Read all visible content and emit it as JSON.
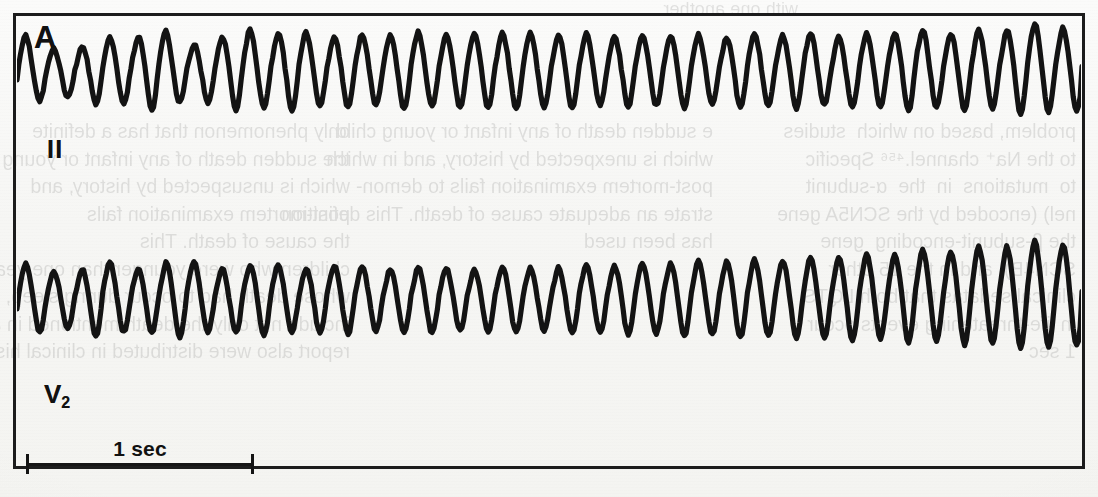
{
  "figure": {
    "panel_label": "A",
    "leads": [
      {
        "name": "lead-II",
        "label": "II",
        "label_sub": ""
      },
      {
        "name": "lead-V2",
        "label": "V",
        "label_sub": "2"
      }
    ],
    "scale_bar": {
      "label": "1 sec",
      "duration_seconds": 1,
      "pixel_length": 228
    },
    "frame_color": "#1a1a1a",
    "trace_color": "#121212",
    "background_color": "#f6f6f4"
  },
  "showthrough_text": {
    "top": "with one another.",
    "left": "problem, based on which  studies\nto the Na⁺ channel.⁴⁵⁶ Specific\nto  mutations  in  the  α-subunit\nnel) (encoded by the SCN5A gene\nthe β-subunit-encoding  gene\nSCN4B), and in the 15 other\nclinical sedatas that both LQTS\nin life-threatening events occur\n1 sec",
    "mid": "e sudden death of any infant or young child\nwhich is unexpected by history, and in which\npost-mortem examination fails to demon-\nstrate an adequate cause of death. This definition\nhas been used",
    "right": "only phenomenon that has a definite\nthe sudden death of any infant or young\nwhich is unsuspected by history, and\npost-mortem examination fails\nthe cause of death. This\nchildren who were younger than one year\nwhose death had to occur during sleep, and had to\ninclude not only the death mentioned in a prior\nreport also were distributed in clinical history, and a"
  },
  "chart_data": {
    "type": "line",
    "title": "A",
    "xlabel": "",
    "ylabel": "",
    "grid": false,
    "legend": "none",
    "x_scale": {
      "bar_label": "1 sec",
      "seconds_per_bar": 1
    },
    "series": [
      {
        "name": "II",
        "note": "Lead II rhythm strip — polymorphic wide-complex tachycardia with undulating (torsades-like) amplitude",
        "baseline_y": 80,
        "cycles": 38,
        "amplitude_envelope": [
          52,
          34,
          30,
          46,
          40,
          58,
          36,
          40,
          56,
          46,
          54,
          42,
          50,
          44,
          52,
          46,
          50,
          48,
          50,
          46,
          50,
          44,
          48,
          44,
          50,
          42,
          50,
          44,
          52,
          42,
          50,
          46,
          56,
          46,
          54,
          48,
          62,
          54
        ]
      },
      {
        "name": "V2",
        "note": "Lead V2 rhythm strip — simultaneous recording, amplitude grows toward right",
        "baseline_y": 308,
        "cycles": 38,
        "amplitude_envelope": [
          50,
          40,
          36,
          52,
          40,
          44,
          54,
          40,
          44,
          48,
          40,
          44,
          46,
          40,
          42,
          44,
          38,
          44,
          42,
          40,
          46,
          42,
          48,
          44,
          50,
          46,
          52,
          48,
          54,
          50,
          58,
          52,
          62,
          56,
          66,
          60,
          72,
          66
        ]
      }
    ]
  }
}
